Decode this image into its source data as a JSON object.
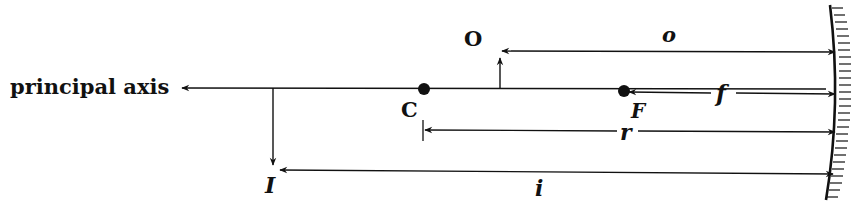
{
  "diagram": {
    "type": "concave-mirror-ray-geometry",
    "labels": {
      "axis": "principal axis",
      "object": "O",
      "image": "I",
      "center": "C",
      "focus": "F",
      "object_distance": "o",
      "focal_length": "f",
      "radius": "r",
      "image_distance": "i"
    },
    "colors": {
      "ink": "#111111",
      "background": "#ffffff"
    }
  }
}
